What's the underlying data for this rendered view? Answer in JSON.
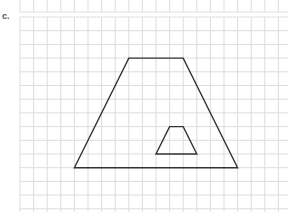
{
  "problem": {
    "label": "c."
  },
  "grid": {
    "origin_x": 20,
    "origin_y": 17,
    "cell_w": 13.6,
    "cell_h": 13.7,
    "cols": 20,
    "rows": 14,
    "line_color": "#dddddd",
    "top_strip": {
      "y0": 0,
      "y1": 12
    }
  },
  "shapes": {
    "stroke_color": "#333333",
    "outer_trapezoid": {
      "name": "large trapezoid",
      "grid_points": [
        [
          8,
          3
        ],
        [
          12,
          3
        ],
        [
          16,
          11
        ],
        [
          4,
          11
        ]
      ]
    },
    "inner_trapezoid": {
      "name": "small trapezoid",
      "grid_points": [
        [
          11,
          8
        ],
        [
          12,
          8
        ],
        [
          13,
          10
        ],
        [
          10,
          10
        ]
      ]
    }
  }
}
